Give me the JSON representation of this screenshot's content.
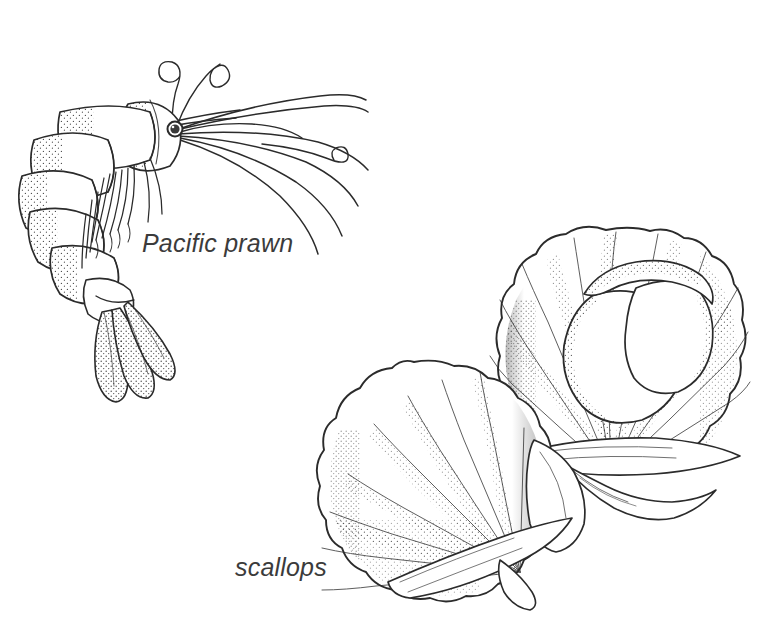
{
  "page": {
    "background_color": "#ffffff",
    "ink_color": "#2b2b2b",
    "label_color": "#3b3b3b",
    "width": 771,
    "height": 617,
    "style": "pen-and-ink stipple line drawing"
  },
  "labels": {
    "prawn": "Pacific prawn",
    "scallops": "scallops"
  },
  "figures": [
    {
      "name": "pacific-prawn",
      "label": "Pacific prawn",
      "description": "Whole raw prawn in side view, body arched with head and eye at upper right, long curling antennae, segmented abdomen curving down to the left and a three-lobed stippled tail fan at bottom",
      "parts": [
        "carapace",
        "eye",
        "antennae",
        "antennules",
        "walking-legs",
        "abdomen-segments",
        "tail-fan"
      ]
    },
    {
      "name": "scallop-open",
      "label": "scallops",
      "description": "Open scallop shell at upper right showing the white adductor muscle and roe inside the fluted fan-shaped valve"
    },
    {
      "name": "scallop-closed",
      "label": "scallops",
      "description": "Second scallop shell at lower left seen from the outside, fan shaped with radiating ribs and a scalloped margin"
    }
  ]
}
